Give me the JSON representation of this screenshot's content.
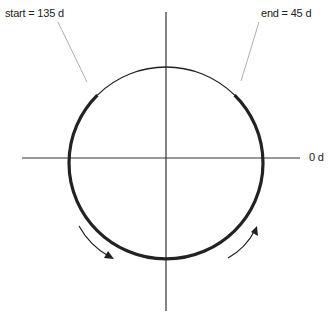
{
  "diagram": {
    "type": "circular arc angle diagram",
    "labels": {
      "start": "start = 135 d",
      "end": "end = 45 d",
      "zero": "0 d"
    },
    "start_angle_deg": 135,
    "end_angle_deg": 45,
    "direction": "counter-clockwise (through bottom)",
    "colors": {
      "stroke": "#222222",
      "leader": "#999999",
      "background": "#ffffff"
    }
  }
}
